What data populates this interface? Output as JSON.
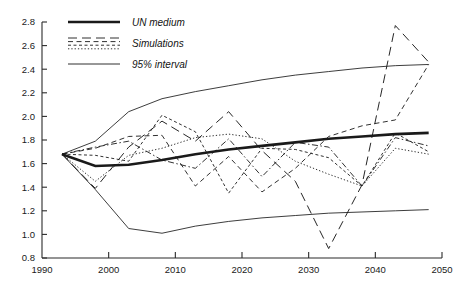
{
  "chart_data": {
    "type": "line",
    "title": "",
    "subtitle": "",
    "xlabel": "",
    "ylabel": "",
    "xlim": [
      1990,
      2050
    ],
    "ylim": [
      0.8,
      2.8
    ],
    "grid": false,
    "legend_position": "top-left",
    "x_ticks": [
      1990,
      2000,
      2010,
      2020,
      2030,
      2040,
      2050
    ],
    "x_tick_labels": [
      "1990",
      "2000",
      "2010",
      "2020",
      "2030",
      "2040",
      "2050"
    ],
    "y_ticks": [
      0.8,
      1.0,
      1.2,
      1.4,
      1.6,
      1.8,
      2.0,
      2.2,
      2.4,
      2.6,
      2.8
    ],
    "y_tick_labels": [
      "0.8",
      "1.0",
      "1.2",
      "1.4",
      "1.6",
      "1.8",
      "2.0",
      "2.2",
      "2.4",
      "2.6",
      "2.8"
    ],
    "legend": [
      {
        "label": "UN medium",
        "style": "solid-thick"
      },
      {
        "label": "Simulations",
        "style": "dashed-multi"
      },
      {
        "label": "95% interval",
        "style": "solid-thin"
      }
    ],
    "series": [
      {
        "name": "UN medium",
        "style": "solid-thick",
        "x": [
          1993,
          1998,
          2003,
          2008,
          2013,
          2018,
          2023,
          2028,
          2033,
          2038,
          2043,
          2048
        ],
        "values": [
          1.68,
          1.58,
          1.59,
          1.63,
          1.68,
          1.72,
          1.75,
          1.78,
          1.81,
          1.83,
          1.85,
          1.86
        ]
      },
      {
        "name": "95% interval upper",
        "style": "solid-thin",
        "x": [
          1993,
          1998,
          2003,
          2008,
          2013,
          2018,
          2023,
          2028,
          2033,
          2038,
          2043,
          2048
        ],
        "values": [
          1.68,
          1.79,
          2.04,
          2.15,
          2.21,
          2.26,
          2.31,
          2.35,
          2.38,
          2.41,
          2.43,
          2.44
        ]
      },
      {
        "name": "95% interval lower",
        "style": "solid-thin",
        "x": [
          1993,
          1998,
          2003,
          2008,
          2013,
          2018,
          2023,
          2028,
          2033,
          2038,
          2043,
          2048
        ],
        "values": [
          1.68,
          1.38,
          1.05,
          1.01,
          1.07,
          1.11,
          1.14,
          1.16,
          1.18,
          1.19,
          1.2,
          1.21
        ]
      },
      {
        "name": "Simulation 1",
        "style": "long-dash",
        "x": [
          1993,
          1998,
          2003,
          2008,
          2013,
          2018,
          2023,
          2028,
          2033,
          2038,
          2043,
          2048
        ],
        "values": [
          1.68,
          1.39,
          1.74,
          1.96,
          1.79,
          2.04,
          1.71,
          1.45,
          0.88,
          1.42,
          2.77,
          2.46
        ]
      },
      {
        "name": "Simulation 2",
        "style": "medium-dash",
        "x": [
          1993,
          1998,
          2003,
          2008,
          2013,
          2018,
          2023,
          2028,
          2033,
          2038,
          2043,
          2048
        ],
        "values": [
          1.68,
          1.73,
          1.83,
          1.84,
          1.41,
          1.66,
          1.36,
          1.56,
          1.83,
          1.92,
          1.97,
          2.44
        ]
      },
      {
        "name": "Simulation 3",
        "style": "short-dash",
        "x": [
          1993,
          1998,
          2003,
          2008,
          2013,
          2018,
          2023,
          2028,
          2033,
          2038,
          2043,
          2048
        ],
        "values": [
          1.68,
          1.67,
          1.62,
          2.01,
          1.87,
          1.35,
          1.73,
          1.72,
          1.65,
          1.41,
          1.86,
          1.7
        ]
      },
      {
        "name": "Simulation 4",
        "style": "dotted",
        "x": [
          1993,
          1998,
          2003,
          2008,
          2013,
          2018,
          2023,
          2028,
          2033,
          2038,
          2043,
          2048
        ],
        "values": [
          1.68,
          1.45,
          1.67,
          1.73,
          1.82,
          1.85,
          1.81,
          1.62,
          1.51,
          1.41,
          1.73,
          1.68
        ]
      },
      {
        "name": "Simulation 5",
        "style": "dash-dot",
        "x": [
          1993,
          1998,
          2003,
          2008,
          2013,
          2018,
          2023,
          2028,
          2033,
          2038,
          2043,
          2048
        ],
        "values": [
          1.68,
          1.74,
          1.79,
          1.63,
          1.56,
          1.81,
          1.49,
          1.78,
          1.74,
          1.41,
          1.82,
          1.75
        ]
      }
    ]
  }
}
